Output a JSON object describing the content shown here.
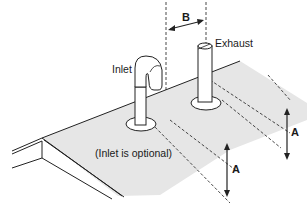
{
  "diagram": {
    "type": "vent-termination-clearance",
    "labels": {
      "inlet": "Inlet",
      "exhaust": "Exhaust",
      "inlet_note": "(Inlet is optional)",
      "dim_a_1": "A",
      "dim_a_2": "A",
      "dim_b": "B"
    },
    "colors": {
      "roof_fill": "#e6e6e6",
      "line": "#222222",
      "background": "#ffffff"
    }
  }
}
